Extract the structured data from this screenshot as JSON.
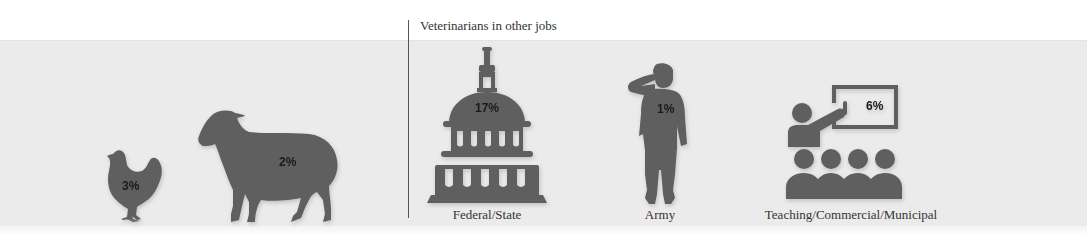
{
  "header": {
    "section_title": "Veterinarians in other jobs"
  },
  "colors": {
    "icon_fill": "#5f5f5f",
    "band_background": "#ebebeb",
    "divider": "#555555",
    "text": "#333333"
  },
  "animals": [
    {
      "icon": "chicken-icon",
      "percent": "3%"
    },
    {
      "icon": "sheep-icon",
      "percent": "2%"
    }
  ],
  "other_jobs": [
    {
      "icon": "capitol-building-icon",
      "percent": "17%",
      "label": "Federal/State"
    },
    {
      "icon": "saluting-soldier-icon",
      "percent": "1%",
      "label": "Army"
    },
    {
      "icon": "teacher-classroom-icon",
      "percent": "6%",
      "label": "Teaching/Commercial/Municipal"
    }
  ]
}
